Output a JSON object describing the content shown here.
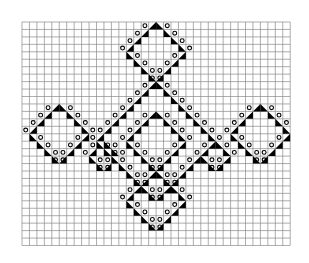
{
  "diagram": {
    "type": "knitting-lace-chart",
    "grid": {
      "cols": 36,
      "rows": 30,
      "origin_x": 22,
      "origin_y": 22,
      "cell": 7.45,
      "line_color": "#8a8a8a"
    },
    "symbol_legend": {
      "triangle_right": "decrease (right-leaning, filled black)",
      "triangle_left": "decrease (left-leaning, filled black)",
      "circle": "yarn over (open circle)"
    },
    "motifs": [
      {
        "name": "top-diamond",
        "peak_col": 17,
        "peak_row": 0,
        "half": 4
      },
      {
        "name": "left-diamond",
        "peak_col": 4,
        "peak_row": 11,
        "half": 4
      },
      {
        "name": "right-diamond",
        "peak_col": 31,
        "peak_row": 11,
        "half": 4
      },
      {
        "name": "center-outer-diamond",
        "peak_col": 17,
        "peak_row": 8,
        "half": 8
      },
      {
        "name": "center-inner-diamond",
        "peak_col": 17,
        "peak_row": 12,
        "half": 4
      },
      {
        "name": "left-small-peak",
        "peak_col": 10,
        "peak_row": 16,
        "half": 2
      },
      {
        "name": "right-small-peak",
        "peak_col": 25,
        "peak_row": 16,
        "half": 2
      },
      {
        "name": "bottom-diamond",
        "peak_col": 17,
        "peak_row": 20,
        "half": 4
      }
    ],
    "colors": {
      "ink": "#000000",
      "paper": "#ffffff"
    }
  }
}
